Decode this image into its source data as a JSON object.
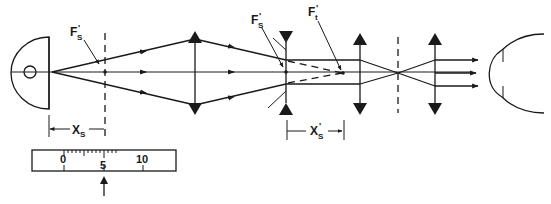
{
  "diagram": {
    "labels": {
      "fs_prime_left": "F",
      "fs_prime_left_sub": "S",
      "fs_prime_mid": "F",
      "fs_prime_mid_sub": "S",
      "ft_prime": "F",
      "ft_prime_sub": "t",
      "prime_mark": "'",
      "xs": "X",
      "xs_sub": "S",
      "xs_prime": "X",
      "xs_prime_sub": "S"
    },
    "scale": {
      "ticks": [
        "0",
        "5",
        "10"
      ],
      "pointer": "arrow-up"
    },
    "colors": {
      "ink": "#1a1a1a",
      "background": "#ffffff"
    }
  }
}
